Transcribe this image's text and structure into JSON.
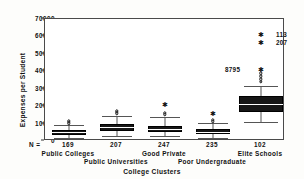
{
  "chart_data": {
    "type": "box",
    "title": "",
    "xlabel": "College Clusters",
    "ylabel": "Expenses per Student",
    "ylim": [
      0,
      70000
    ],
    "yticks": [
      0,
      10000,
      20000,
      30000,
      40000,
      50000,
      60000,
      70000
    ],
    "ytick_labels": [
      "0",
      "10000",
      "20000",
      "30000",
      "40000",
      "50000",
      "60000",
      "70000"
    ],
    "grid": false,
    "legend": "none",
    "n_prefix": "N =",
    "categories": [
      "Public Colleges",
      "Public Universities",
      "Good Private",
      "Poor Undergraduate",
      "Elite Schools"
    ],
    "counts": [
      "169",
      "207",
      "247",
      "235",
      "102"
    ],
    "boxes": [
      {
        "category": "Public Colleges",
        "n": 169,
        "whisker_low": 1800,
        "q1": 3600,
        "median": 5000,
        "q3": 6400,
        "whisker_high": 9200,
        "outliers_mild": [
          10100,
          10900,
          11500
        ],
        "outliers_extreme": []
      },
      {
        "category": "Public Universities",
        "n": 207,
        "whisker_low": 3000,
        "q1": 6000,
        "median": 7900,
        "q3": 9900,
        "whisker_high": 14500,
        "outliers_mild": [
          15800,
          16600,
          17400
        ],
        "outliers_extreme": []
      },
      {
        "category": "Good Private",
        "n": 247,
        "whisker_low": 2600,
        "q1": 5300,
        "median": 7000,
        "q3": 8800,
        "whisker_high": 13900,
        "outliers_mild": [
          15300,
          16200
        ],
        "outliers_extreme": [
          20600
        ]
      },
      {
        "category": "Poor Undergraduate",
        "n": 235,
        "whisker_low": 1900,
        "q1": 3900,
        "median": 5200,
        "q3": 6700,
        "whisker_high": 10100,
        "outliers_mild": [
          11400,
          12100
        ],
        "outliers_extreme": [
          15600
        ]
      },
      {
        "category": "Elite Schools",
        "n": 102,
        "whisker_low": 10900,
        "q1": 16400,
        "median": 21200,
        "q3": 25900,
        "whisker_high": 31600,
        "outliers_mild": [
          33800,
          35500,
          37200,
          38800
        ],
        "outliers_extreme": [
          41000,
          56000,
          61000
        ]
      }
    ],
    "annotations": [
      {
        "text": "113",
        "value": 61000,
        "placement": "right"
      },
      {
        "text": "207",
        "value": 56000,
        "placement": "right"
      },
      {
        "text": "8795",
        "value": 41000,
        "placement": "left"
      }
    ]
  }
}
